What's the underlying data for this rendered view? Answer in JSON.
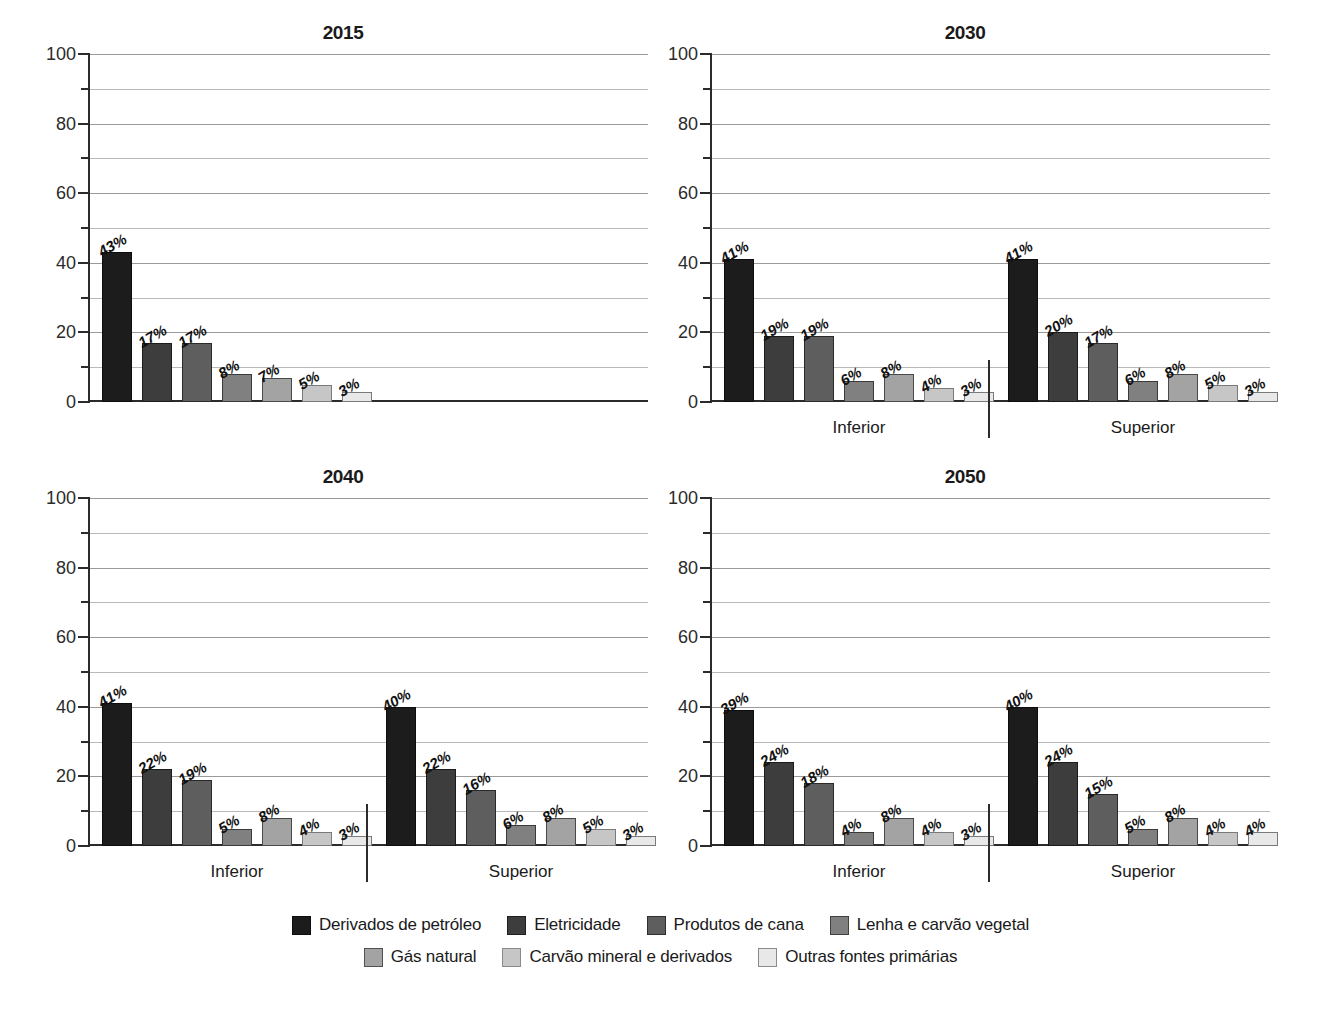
{
  "series": [
    {
      "key": "derivados_petroleo",
      "label": "Derivados de petróleo",
      "color": "#1c1c1c"
    },
    {
      "key": "eletricidade",
      "label": "Eletricidade",
      "color": "#3d3d3d"
    },
    {
      "key": "produtos_cana",
      "label": "Produtos de cana",
      "color": "#5e5e5e"
    },
    {
      "key": "lenha_carvao_vegetal",
      "label": "Lenha e carvão vegetal",
      "color": "#808080"
    },
    {
      "key": "gas_natural",
      "label": "Gás natural",
      "color": "#a3a3a3"
    },
    {
      "key": "carvao_mineral",
      "label": "Carvão mineral e derivados",
      "color": "#c6c6c6"
    },
    {
      "key": "outras_fontes",
      "label": "Outras fontes primárias",
      "color": "#e8e8e8"
    }
  ],
  "axis": {
    "ymin": 0,
    "ymax": 100,
    "major_ticks": [
      0,
      20,
      40,
      60,
      80,
      100
    ],
    "minor_ticks": [
      10,
      30,
      50,
      70,
      90
    ],
    "tick_labels": [
      "0",
      "20",
      "40",
      "60",
      "80",
      "100"
    ]
  },
  "group_names": {
    "inferior": "Inferior",
    "superior": "Superior"
  },
  "legend": {
    "row1": [
      "Derivados de petróleo",
      "Eletricidade",
      "Produtos de cana",
      "Lenha e carvão vegetal"
    ],
    "row2": [
      "Gás natural",
      "Carvão mineral e derivados",
      "Outras fontes primárias"
    ]
  },
  "chart_data": {
    "type": "bar",
    "title": "",
    "xlabel": "",
    "ylabel": "",
    "ylim": [
      0,
      100
    ],
    "grid": true,
    "legend_position": "bottom",
    "categories": [
      "Derivados de petróleo",
      "Eletricidade",
      "Produtos de cana",
      "Lenha e carvão vegetal",
      "Gás natural",
      "Carvão mineral e derivados",
      "Outras fontes primárias"
    ],
    "panels": [
      {
        "title": "2015",
        "groups": [
          {
            "name": "",
            "values": [
              43,
              17,
              17,
              8,
              7,
              5,
              3
            ],
            "labels": [
              "43%",
              "17%",
              "17%",
              "8%",
              "7%",
              "5%",
              "3%"
            ]
          }
        ]
      },
      {
        "title": "2030",
        "groups": [
          {
            "name": "Inferior",
            "values": [
              41,
              19,
              19,
              6,
              8,
              4,
              3
            ],
            "labels": [
              "41%",
              "19%",
              "19%",
              "6%",
              "8%",
              "4%",
              "3%"
            ]
          },
          {
            "name": "Superior",
            "values": [
              41,
              20,
              17,
              6,
              8,
              5,
              3
            ],
            "labels": [
              "41%",
              "20%",
              "17%",
              "6%",
              "8%",
              "5%",
              "3%"
            ]
          }
        ]
      },
      {
        "title": "2040",
        "groups": [
          {
            "name": "Inferior",
            "values": [
              41,
              22,
              19,
              5,
              8,
              4,
              3
            ],
            "labels": [
              "41%",
              "22%",
              "19%",
              "5%",
              "8%",
              "4%",
              "3%"
            ]
          },
          {
            "name": "Superior",
            "values": [
              40,
              22,
              16,
              6,
              8,
              5,
              3
            ],
            "labels": [
              "40%",
              "22%",
              "16%",
              "6%",
              "8%",
              "5%",
              "3%"
            ]
          }
        ]
      },
      {
        "title": "2050",
        "groups": [
          {
            "name": "Inferior",
            "values": [
              39,
              24,
              18,
              4,
              8,
              4,
              3
            ],
            "labels": [
              "39%",
              "24%",
              "18%",
              "4%",
              "8%",
              "4%",
              "3%"
            ]
          },
          {
            "name": "Superior",
            "values": [
              40,
              24,
              15,
              5,
              8,
              4,
              4
            ],
            "labels": [
              "40%",
              "24%",
              "15%",
              "5%",
              "8%",
              "4%",
              "4%"
            ]
          }
        ]
      }
    ]
  }
}
